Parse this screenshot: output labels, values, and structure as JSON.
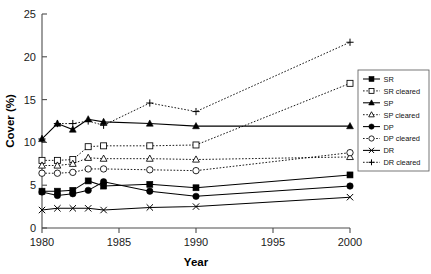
{
  "chart_data": {
    "type": "line",
    "title": "",
    "xlabel": "Year",
    "ylabel": "Cover (%)",
    "xlim": [
      1980,
      2000
    ],
    "ylim": [
      0,
      25
    ],
    "xticks": [
      1980,
      1985,
      1990,
      1995,
      2000
    ],
    "yticks": [
      0,
      5,
      10,
      15,
      20,
      25
    ],
    "grid": false,
    "legend_position": "right",
    "x": [
      1980,
      1981,
      1982,
      1983,
      1984,
      1987,
      1990,
      2000
    ],
    "series": [
      {
        "name": "SR",
        "marker": "filled-square",
        "line": "solid",
        "values": [
          4.3,
          4.3,
          4.4,
          5.5,
          4.9,
          5.1,
          4.7,
          6.2
        ]
      },
      {
        "name": "SR cleared",
        "marker": "open-square",
        "line": "dotted",
        "values": [
          7.9,
          7.9,
          8.0,
          9.5,
          9.6,
          9.6,
          9.7,
          16.9
        ]
      },
      {
        "name": "SP",
        "marker": "filled-triangle",
        "line": "solid",
        "values": [
          10.4,
          12.2,
          11.5,
          12.7,
          12.4,
          12.2,
          11.9,
          11.9
        ]
      },
      {
        "name": "SP cleared",
        "marker": "open-triangle",
        "line": "dotted",
        "values": [
          7.3,
          7.3,
          7.5,
          8.2,
          8.1,
          8.1,
          8.0,
          8.3
        ]
      },
      {
        "name": "DP",
        "marker": "filled-circle",
        "line": "solid",
        "values": [
          4.2,
          3.8,
          4.0,
          4.4,
          5.4,
          4.3,
          3.7,
          4.9
        ]
      },
      {
        "name": "DP cleared",
        "marker": "open-circle",
        "line": "dotted",
        "values": [
          6.4,
          6.4,
          6.5,
          6.9,
          6.9,
          6.8,
          6.7,
          8.8
        ]
      },
      {
        "name": "DR",
        "marker": "cross-x",
        "line": "solid",
        "values": [
          2.1,
          2.3,
          2.3,
          2.3,
          2.1,
          2.4,
          2.5,
          3.6
        ]
      },
      {
        "name": "DR cleared",
        "marker": "plus",
        "line": "dotted",
        "values": [
          10.4,
          12.2,
          12.2,
          12.5,
          12.0,
          14.6,
          13.6,
          21.7
        ]
      }
    ]
  },
  "axes": {
    "ylabel": "Cover (%)",
    "xlabel": "Year",
    "ytick_labels": [
      "0",
      "5",
      "10",
      "15",
      "20",
      "25"
    ],
    "xtick_labels": [
      "1980",
      "1985",
      "1990",
      "1995",
      "2000"
    ]
  },
  "legend": {
    "items": [
      {
        "label": "SR"
      },
      {
        "label": "SR cleared"
      },
      {
        "label": "SP"
      },
      {
        "label": "SP cleared"
      },
      {
        "label": "DP"
      },
      {
        "label": "DP cleared"
      },
      {
        "label": "DR"
      },
      {
        "label": "DR cleared"
      }
    ]
  }
}
